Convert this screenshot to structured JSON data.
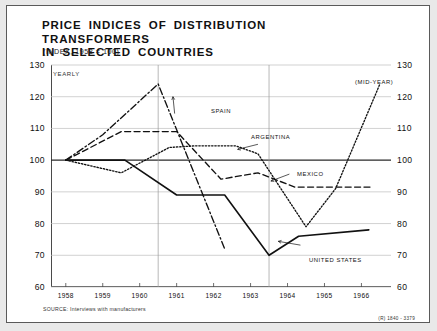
{
  "header": {
    "title_line1": "PRICE INDICES OF DISTRIBUTION TRANSFORMERS",
    "title_line2": "IN SELECTED COUNTRIES",
    "subtitle": "(INDEX, 1958 = 100)"
  },
  "annotations": {
    "yearly": "YEARLY",
    "mid_year": "(MID-YEAR)",
    "spain": "SPAIN",
    "argentina": "ARGENTINA",
    "mexico": "MEXICO",
    "united_states": "UNITED STATES"
  },
  "footer": {
    "source": "SOURCE: Interviews with manufacturers",
    "doc_id": "(R) 1840 - 3379"
  },
  "chart_data": {
    "type": "line",
    "title": "PRICE INDICES OF DISTRIBUTION TRANSFORMERS IN SELECTED COUNTRIES",
    "subtitle": "(INDEX, 1958 = 100)",
    "xlabel": "",
    "ylabel": "",
    "xlim": [
      1957.6,
      1966.8
    ],
    "ylim": [
      60,
      130
    ],
    "yticks": [
      60,
      70,
      80,
      90,
      100,
      110,
      120,
      130
    ],
    "ytick_labels_left": [
      "60",
      "70",
      "80",
      "90",
      "100",
      "110",
      "120",
      "130"
    ],
    "ytick_labels_right": [
      "60",
      "70",
      "80",
      "90",
      "100",
      "110",
      "120",
      "130"
    ],
    "xticks": [
      1958,
      1959,
      1960,
      1961,
      1962,
      1963,
      1964,
      1965,
      1966
    ],
    "xtick_labels": [
      "1958",
      "1959",
      "1960",
      "1961",
      "1962",
      "1963",
      "1964",
      "1965",
      "1966"
    ],
    "grid": "horizontal-gridlines-at-every-10-plus-vertical-rules-at-1960.5-and-1963.5",
    "vertical_rules": [
      1960.5,
      1963.5
    ],
    "baseline_emphasis": 100,
    "legend": "inline-labels-with-leader-lines",
    "series": [
      {
        "name": "SPAIN",
        "style": "dash-dot",
        "color": "#111111",
        "x": [
          1958.0,
          1959.0,
          1960.5,
          1962.3
        ],
        "values": [
          100,
          108,
          124,
          72
        ]
      },
      {
        "name": "ARGENTINA",
        "style": "dotted",
        "color": "#111111",
        "x": [
          1958.0,
          1959.5,
          1960.8,
          1961.5,
          1962.6,
          1963.2,
          1964.5,
          1965.3,
          1966.5
        ],
        "values": [
          100,
          96,
          104,
          104.5,
          104.5,
          102,
          79,
          91,
          124
        ]
      },
      {
        "name": "MEXICO",
        "style": "dashed",
        "color": "#111111",
        "x": [
          1958.0,
          1959.5,
          1961.0,
          1962.2,
          1963.2,
          1964.2,
          1966.3
        ],
        "values": [
          100,
          109,
          109,
          94,
          96,
          91.5,
          91.5
        ]
      },
      {
        "name": "UNITED STATES",
        "style": "solid",
        "color": "#111111",
        "x": [
          1958.0,
          1959.6,
          1961.0,
          1962.3,
          1963.5,
          1964.3,
          1966.2
        ],
        "values": [
          100,
          100,
          89,
          89,
          70,
          76,
          78
        ]
      }
    ]
  }
}
